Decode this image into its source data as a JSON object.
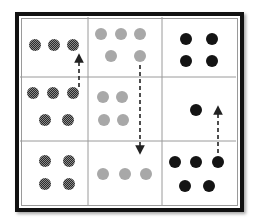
{
  "diagram": {
    "grid": {
      "rows": 3,
      "cols": 3
    },
    "colors": {
      "frame": "#111111",
      "gridline": "#9a9a9a",
      "checkered_dot": "#3a3a3a",
      "gray_dot": "#a8a8a8",
      "black_dot": "#141414",
      "arrow": "#222222"
    },
    "cells": [
      {
        "row": 0,
        "col": 0,
        "dot_style": "checkered",
        "count": 3
      },
      {
        "row": 0,
        "col": 1,
        "dot_style": "gray",
        "count": 5
      },
      {
        "row": 0,
        "col": 2,
        "dot_style": "black",
        "count": 4
      },
      {
        "row": 1,
        "col": 0,
        "dot_style": "checkered",
        "count": 5
      },
      {
        "row": 1,
        "col": 1,
        "dot_style": "gray",
        "count": 4
      },
      {
        "row": 1,
        "col": 2,
        "dot_style": "black",
        "count": 1
      },
      {
        "row": 2,
        "col": 0,
        "dot_style": "checkered",
        "count": 4
      },
      {
        "row": 2,
        "col": 1,
        "dot_style": "gray",
        "count": 3
      },
      {
        "row": 2,
        "col": 2,
        "dot_style": "black",
        "count": 5
      }
    ],
    "arrows": [
      {
        "from": "row1-col0",
        "to": "row0-col0",
        "direction": "up",
        "style": "dashed"
      },
      {
        "from": "row0-col1",
        "to": "row2-col1",
        "direction": "down",
        "style": "dashed"
      },
      {
        "from": "row2-col2",
        "to": "row1-col2",
        "direction": "up",
        "style": "dashed"
      }
    ]
  }
}
